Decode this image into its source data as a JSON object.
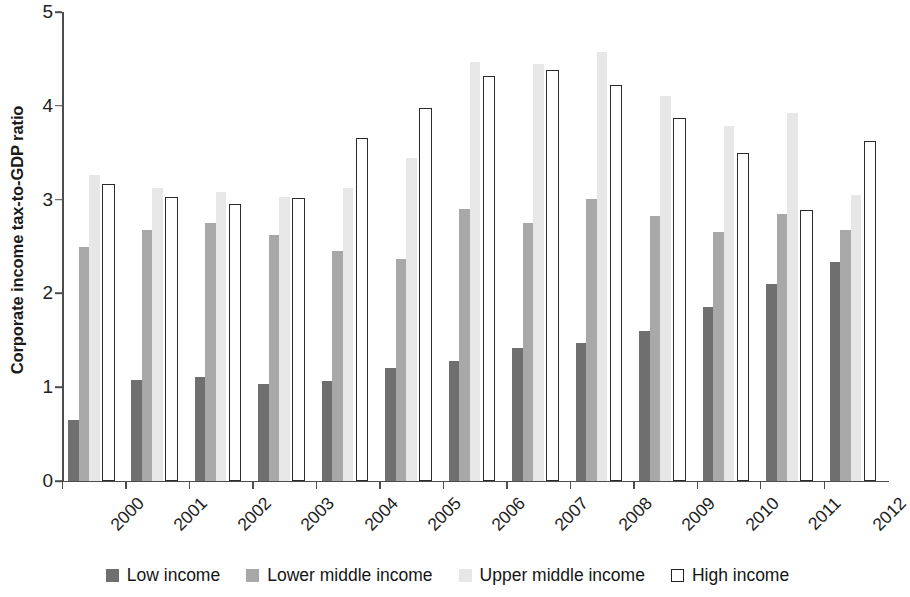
{
  "chart_data": {
    "type": "bar",
    "title": "",
    "subtitle": "",
    "xlabel": "",
    "ylabel": "Corporate income tax-to-GDP ratio",
    "ylim": [
      0,
      5
    ],
    "yticks": [
      0,
      1,
      2,
      3,
      4,
      5
    ],
    "ytick_labels": [
      "0",
      "1",
      "2",
      "3",
      "4",
      "5"
    ],
    "grid": false,
    "legend_position": "bottom",
    "categories": [
      "2000",
      "2001",
      "2002",
      "2003",
      "2004",
      "2005",
      "2006",
      "2007",
      "2008",
      "2009",
      "2010",
      "2011",
      "2012"
    ],
    "series": [
      {
        "name": "Low income",
        "color": "#6f6f6f",
        "values": [
          0.65,
          1.08,
          1.11,
          1.03,
          1.07,
          1.2,
          1.28,
          1.42,
          1.47,
          1.6,
          1.85,
          2.1,
          2.34
        ]
      },
      {
        "name": "Lower middle income",
        "color": "#a8a8a8",
        "values": [
          2.5,
          2.68,
          2.75,
          2.62,
          2.45,
          2.37,
          2.9,
          2.75,
          3.01,
          2.82,
          2.65,
          2.85,
          2.68
        ]
      },
      {
        "name": "Upper middle income",
        "color": "#e7e7e7",
        "values": [
          3.26,
          3.12,
          3.08,
          3.03,
          3.12,
          3.44,
          4.47,
          4.45,
          4.57,
          4.1,
          3.78,
          3.92,
          3.05
        ]
      },
      {
        "name": "High income",
        "color": "#ffffff",
        "edge_color": "#2b2b2b",
        "values": [
          3.17,
          3.03,
          2.95,
          3.02,
          3.66,
          3.98,
          4.32,
          4.38,
          4.22,
          3.87,
          3.5,
          2.89,
          3.62
        ]
      }
    ]
  },
  "legend": {
    "entries": [
      {
        "label": "Low income",
        "style": "low"
      },
      {
        "label": "Lower middle income",
        "style": "lowmid"
      },
      {
        "label": "Upper middle income",
        "style": "upmid"
      },
      {
        "label": "High income",
        "style": "high"
      }
    ]
  }
}
